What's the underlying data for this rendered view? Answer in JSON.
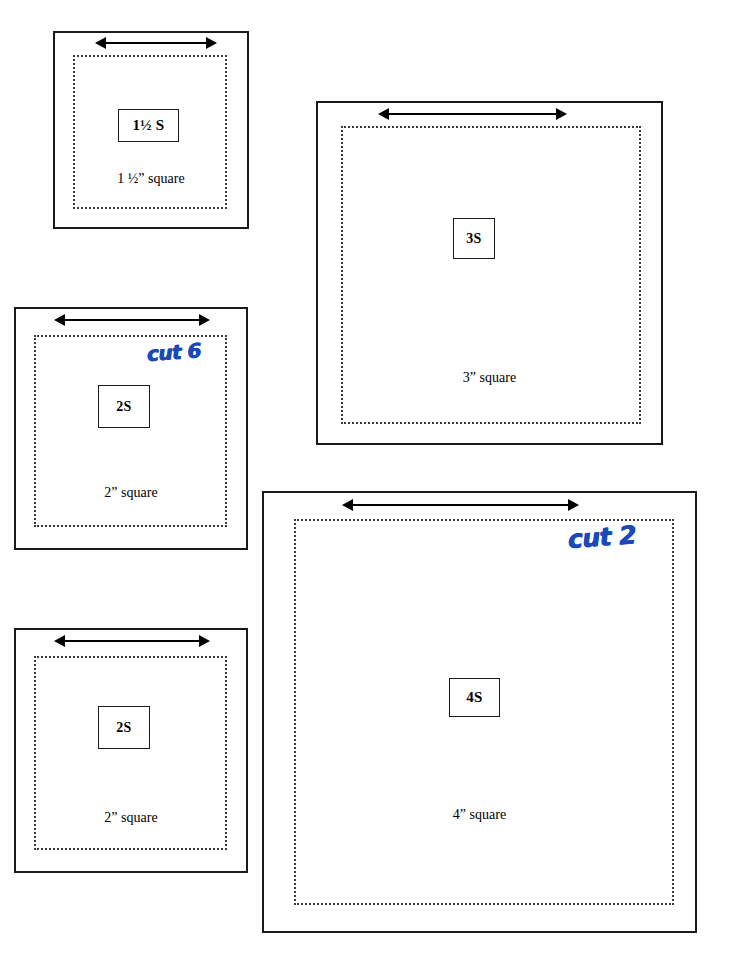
{
  "document": {
    "title": "Quilting Square Cutting Templates",
    "background_color": "#ffffff",
    "ink_color": "#000000",
    "annotation_color": "#1b49b8"
  },
  "panels": [
    {
      "id": "one-and-half-inch-square",
      "code_label": "1½ S",
      "caption": "1 ½” square",
      "arrow_name": "width-measure-arrow",
      "annotation": null
    },
    {
      "id": "two-inch-square-top",
      "code_label": "2S",
      "caption": "2” square",
      "arrow_name": "width-measure-arrow",
      "annotation": "cut 6"
    },
    {
      "id": "two-inch-square-bottom",
      "code_label": "2S",
      "caption": "2” square",
      "arrow_name": "width-measure-arrow",
      "annotation": null
    },
    {
      "id": "three-inch-square",
      "code_label": "3S",
      "caption": "3” square",
      "arrow_name": "width-measure-arrow",
      "annotation": null
    },
    {
      "id": "four-inch-square",
      "code_label": "4S",
      "caption": "4” square",
      "arrow_name": "width-measure-arrow",
      "annotation": "cut 2"
    }
  ]
}
